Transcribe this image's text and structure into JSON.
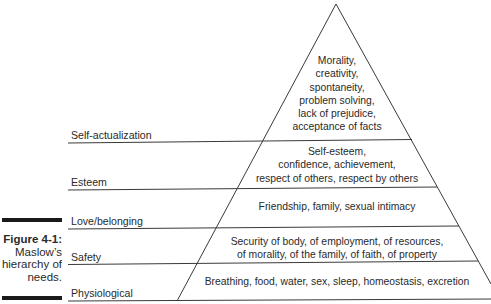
{
  "figure": {
    "number": "Figure 4-1:",
    "caption_lines": [
      "Maslow’s",
      "hierarchy of",
      "needs."
    ]
  },
  "levels": [
    {
      "name": "Self-actualization",
      "description_lines": [
        "Morality,",
        "creativity,",
        "spontaneity,",
        "problem solving,",
        "lack of prejudice,",
        "acceptance of facts"
      ]
    },
    {
      "name": "Esteem",
      "description_lines": [
        "Self-esteem,",
        "confidence, achievement,",
        "respect of others, respect by others"
      ]
    },
    {
      "name": "Love/belonging",
      "description_lines": [
        "Friendship, family, sexual intimacy"
      ]
    },
    {
      "name": "Safety",
      "description_lines": [
        "Security of body, of employment, of resources,",
        "of morality, of the family, of faith, of property"
      ]
    },
    {
      "name": "Physiological",
      "description_lines": [
        "Breathing, food, water, sex, sleep, homeostasis, excretion"
      ]
    }
  ],
  "colors": {
    "line": "#3a3a3a",
    "text": "#2a2a2a",
    "bar": "#1a1a1a"
  }
}
